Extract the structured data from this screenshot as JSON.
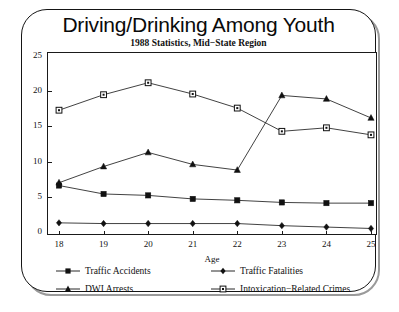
{
  "chart_data": {
    "type": "line",
    "title": "Driving/Drinking Among Youth",
    "subtitle": "1988 Statistics, Mid−State Region",
    "xlabel": "Age",
    "ylabel": "Thousands",
    "categories": [
      18,
      19,
      20,
      21,
      22,
      23,
      24,
      25
    ],
    "x_tick_labels": [
      "18",
      "19",
      "20",
      "21",
      "22",
      "23",
      "24",
      "25"
    ],
    "y_tick_labels": [
      "0",
      "5",
      "10",
      "15",
      "20",
      "25"
    ],
    "y_ticks": [
      0,
      5,
      10,
      15,
      20,
      25
    ],
    "ylim": [
      0,
      25
    ],
    "xlim": [
      18,
      25
    ],
    "grid": false,
    "legend_position": "below-axes",
    "series": [
      {
        "name": "Traffic Accidents",
        "marker": "filled-square",
        "color": "#111111",
        "values": [
          6.6,
          5.4,
          5.2,
          4.7,
          4.5,
          4.2,
          4.1,
          4.1
        ]
      },
      {
        "name": "Traffic Fatalities",
        "marker": "filled-diamond",
        "color": "#111111",
        "values": [
          1.3,
          1.2,
          1.2,
          1.2,
          1.2,
          0.9,
          0.7,
          0.5
        ]
      },
      {
        "name": "DWI Arrests",
        "marker": "filled-triangle",
        "color": "#111111",
        "values": [
          7.0,
          9.3,
          11.3,
          9.6,
          8.8,
          19.4,
          18.9,
          16.2
        ]
      },
      {
        "name": "Intoxication−Related Crimes",
        "marker": "open-square",
        "color": "#111111",
        "values": [
          17.3,
          19.5,
          21.2,
          19.6,
          17.6,
          14.3,
          14.8,
          13.8
        ]
      }
    ]
  },
  "legend": {
    "items": [
      {
        "label": "Traffic Accidents",
        "marker": "filled-square"
      },
      {
        "label": "Traffic Fatalities",
        "marker": "filled-diamond"
      },
      {
        "label": "DWI Arrests",
        "marker": "filled-triangle"
      },
      {
        "label": "Intoxication−Related Crimes",
        "marker": "open-square"
      }
    ]
  }
}
